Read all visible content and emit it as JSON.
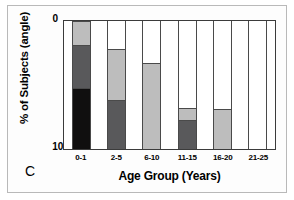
{
  "panel": {
    "letter": "C"
  },
  "chart_data": {
    "type": "bar",
    "subtype": "stacked-bar",
    "title": "",
    "panel_label": "C",
    "xlabel": "Age Group (Years)",
    "ylabel": "% of Subjects (angle)",
    "categories": [
      "0-1",
      "2-5",
      "6-10",
      "11-15",
      "16-20",
      "21-25"
    ],
    "ylim": [
      0,
      100
    ],
    "yticks": [
      0,
      100
    ],
    "ytick_labels": [
      "0",
      "100"
    ],
    "grid": false,
    "legend": "none",
    "series": [
      {
        "name": "black",
        "color": "#100f0f",
        "values": [
          48,
          0,
          0,
          0,
          0,
          0
        ]
      },
      {
        "name": "dark-gray",
        "color": "#59595b",
        "values": [
          33,
          38,
          0,
          23,
          0,
          0
        ]
      },
      {
        "name": "light-gray",
        "color": "#bdbdbd",
        "values": [
          19,
          40,
          67,
          9,
          31,
          0
        ]
      },
      {
        "name": "white",
        "color": "#ffffff",
        "values": [
          0,
          22,
          33,
          68,
          69,
          100
        ]
      }
    ],
    "totals": [
      100,
      100,
      100,
      100,
      100,
      100
    ],
    "bars": [
      {
        "category": "0-1",
        "segments": [
          {
            "name": "light-gray",
            "value": 19,
            "color": "#bdbdbd"
          },
          {
            "name": "dark-gray",
            "value": 33,
            "color": "#59595b"
          },
          {
            "name": "black",
            "value": 48,
            "color": "#100f0f"
          }
        ]
      },
      {
        "category": "2-5",
        "segments": [
          {
            "name": "white",
            "value": 22,
            "color": "#ffffff"
          },
          {
            "name": "light-gray",
            "value": 40,
            "color": "#bdbdbd"
          },
          {
            "name": "dark-gray",
            "value": 38,
            "color": "#59595b"
          }
        ]
      },
      {
        "category": "6-10",
        "segments": [
          {
            "name": "white",
            "value": 33,
            "color": "#ffffff"
          },
          {
            "name": "light-gray",
            "value": 67,
            "color": "#bdbdbd"
          }
        ]
      },
      {
        "category": "11-15",
        "segments": [
          {
            "name": "white",
            "value": 68,
            "color": "#ffffff"
          },
          {
            "name": "light-gray",
            "value": 9,
            "color": "#bdbdbd"
          },
          {
            "name": "dark-gray",
            "value": 23,
            "color": "#59595b"
          }
        ]
      },
      {
        "category": "16-20",
        "segments": [
          {
            "name": "white",
            "value": 69,
            "color": "#ffffff"
          },
          {
            "name": "light-gray",
            "value": 31,
            "color": "#bdbdbd"
          }
        ]
      },
      {
        "category": "21-25",
        "segments": [
          {
            "name": "white",
            "value": 100,
            "color": "#ffffff"
          }
        ]
      }
    ]
  },
  "colors": {
    "black_segment": "#100f0f",
    "dark_gray_segment": "#59595b",
    "light_gray_segment": "#bdbdbd",
    "white_segment": "#ffffff",
    "axis": "#3b3b3b",
    "figure_border": "#b9b9b9",
    "text": "#000000"
  }
}
